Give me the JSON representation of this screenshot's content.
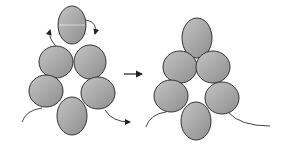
{
  "diagram": {
    "colors": {
      "bead_fill": "#a8a8a8",
      "bead_stroke": "#333333",
      "thread": "#444444",
      "background": "#ffffff"
    },
    "before": {
      "beads": [
        {
          "id": "top",
          "cx": 72,
          "cy": 25,
          "rx": 14,
          "ry": 19
        },
        {
          "id": "upper-left",
          "cx": 56,
          "cy": 62,
          "rx": 17,
          "ry": 16
        },
        {
          "id": "upper-right",
          "cx": 90,
          "cy": 62,
          "rx": 16,
          "ry": 17
        },
        {
          "id": "mid-left",
          "cx": 46,
          "cy": 91,
          "rx": 17,
          "ry": 16
        },
        {
          "id": "mid-right",
          "cx": 98,
          "cy": 93,
          "rx": 17,
          "ry": 16
        },
        {
          "id": "bottom",
          "cx": 72,
          "cy": 116,
          "rx": 15,
          "ry": 19
        }
      ]
    },
    "after": {
      "beads": [
        {
          "id": "top",
          "cx": 197,
          "cy": 38,
          "rx": 15,
          "ry": 20
        },
        {
          "id": "upper-left",
          "cx": 180,
          "cy": 67,
          "rx": 17,
          "ry": 16
        },
        {
          "id": "upper-right",
          "cx": 213,
          "cy": 67,
          "rx": 17,
          "ry": 16
        },
        {
          "id": "mid-left",
          "cx": 171,
          "cy": 96,
          "rx": 17,
          "ry": 16
        },
        {
          "id": "mid-right",
          "cx": 222,
          "cy": 98,
          "rx": 17,
          "ry": 16
        },
        {
          "id": "bottom",
          "cx": 196,
          "cy": 121,
          "rx": 15,
          "ry": 19
        }
      ]
    },
    "transition_arrow": {
      "x1": 124,
      "y1": 74,
      "x2": 143,
      "y2": 74
    }
  }
}
